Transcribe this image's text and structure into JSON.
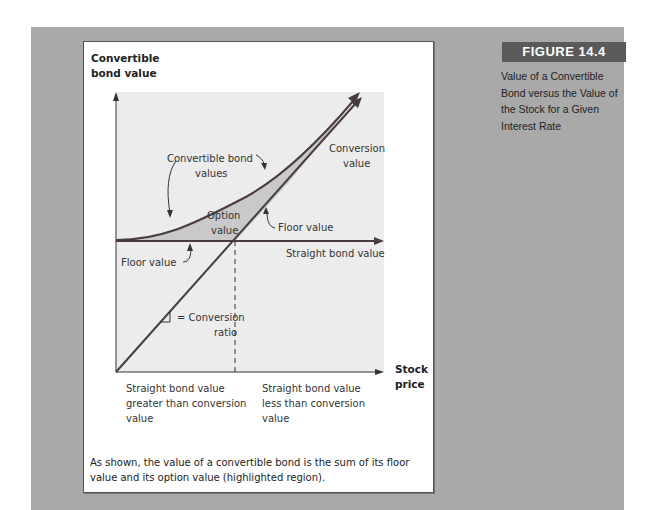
{
  "figure": {
    "label": "FIGURE 14.4",
    "caption": "Value of a Convertible Bond versus the Value of the Stock for a Given Interest Rate",
    "bottom_note": "As shown, the value of a convertible bond is the sum of its floor value and its option value (highlighted region)."
  },
  "diagram": {
    "y_axis_label_line1": "Convertible",
    "y_axis_label_line2": "bond value",
    "x_axis_label_line1": "Stock",
    "x_axis_label_line2": "price",
    "annotations": {
      "convertible_bond_values_1": "Convertible bond",
      "convertible_bond_values_2": "values",
      "conversion_value_1": "Conversion",
      "conversion_value_2": "value",
      "option_value_1": "Option",
      "option_value_2": "value",
      "floor_value_right": "Floor value",
      "floor_value_left": "Floor value",
      "straight_bond_value": "Straight bond value",
      "conversion_ratio_1": "= Conversion",
      "conversion_ratio_2": "ratio"
    },
    "regions": {
      "left_1": "Straight bond value",
      "left_2": "greater than conversion",
      "left_3": "value",
      "right_1": "Straight bond value",
      "right_2": "less than conversion",
      "right_3": "value"
    },
    "colors": {
      "background": "#a9a9a9",
      "plot_area": "#ececec",
      "highlight": "#c9c9c9",
      "line": "#4a3c3c",
      "label_bar": "#5a5a5a"
    }
  }
}
